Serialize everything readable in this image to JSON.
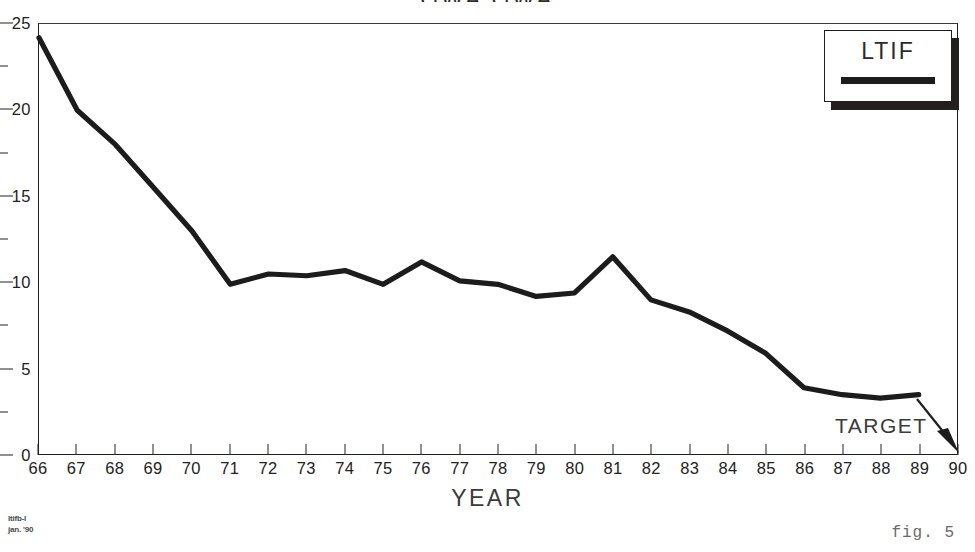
{
  "title": "GWA  GWA",
  "legend": {
    "label": "LTIF",
    "swatch_color": "#1c1c1c"
  },
  "annotations": {
    "target_label": "TARGET"
  },
  "footer": {
    "code_line1": "ltifb-l",
    "code_line2": "jan. '90",
    "figure": "fig. 5"
  },
  "chart_data": {
    "type": "line",
    "title": "GWA  GWA",
    "xlabel": "YEAR",
    "ylabel": "",
    "xlim": [
      66,
      90
    ],
    "ylim": [
      0,
      25
    ],
    "grid": false,
    "legend_position": "top-right",
    "y_major_ticks": [
      0,
      5,
      10,
      15,
      20,
      25
    ],
    "y_minor_ticks": [
      2.5,
      7.5,
      12.5,
      17.5,
      22.5
    ],
    "x_tick_labels": [
      "66",
      "67",
      "68",
      "69",
      "70",
      "71",
      "72",
      "73",
      "74",
      "75",
      "76",
      "77",
      "78",
      "79",
      "80",
      "81",
      "82",
      "83",
      "84",
      "85",
      "86",
      "87",
      "88",
      "89",
      "90"
    ],
    "series": [
      {
        "name": "LTIF",
        "color": "#1c1c1c",
        "x": [
          66,
          67,
          68,
          69,
          70,
          71,
          72,
          73,
          74,
          75,
          76,
          77,
          78,
          79,
          80,
          81,
          82,
          83,
          84,
          85,
          86,
          87,
          88,
          89
        ],
        "values": [
          24.2,
          20.0,
          18.0,
          15.5,
          13.0,
          9.9,
          10.5,
          10.4,
          10.7,
          9.9,
          11.2,
          10.1,
          9.9,
          9.2,
          9.4,
          11.5,
          9.0,
          8.3,
          7.2,
          5.9,
          3.9,
          3.5,
          3.3,
          3.5
        ]
      }
    ],
    "annotations": [
      {
        "text": "TARGET",
        "x": 90,
        "y": 0,
        "arrow": true
      }
    ]
  }
}
